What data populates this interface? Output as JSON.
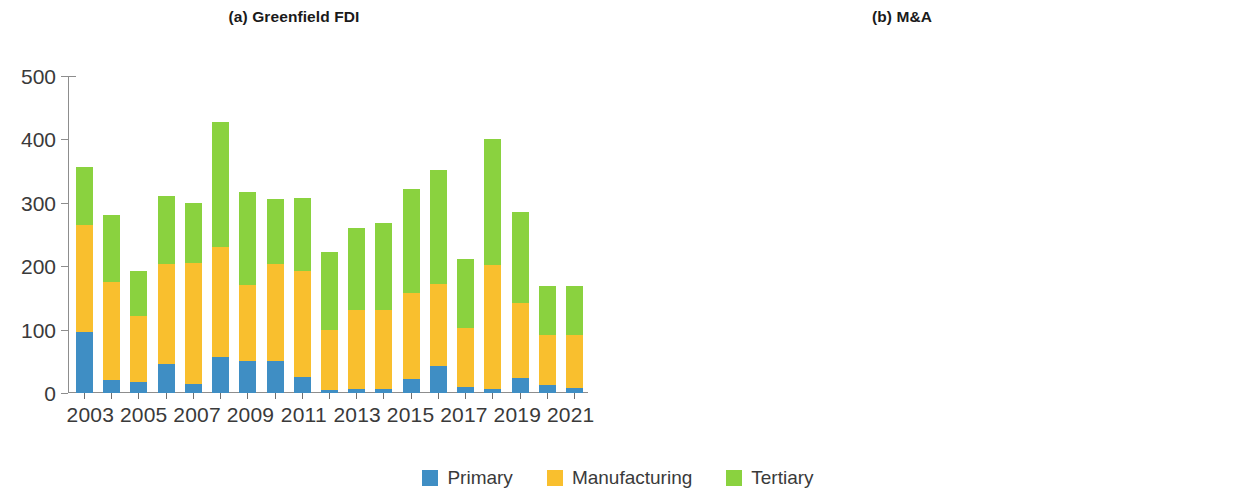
{
  "figure": {
    "series_colors": {
      "primary": "#3f8ec4",
      "manufacturing": "#f9bf2e",
      "tertiary": "#8ad23f"
    }
  },
  "legend": {
    "items": [
      {
        "label": "Primary",
        "color": "#3f8ec4",
        "swatch": "primary-swatch"
      },
      {
        "label": "Manufacturing",
        "color": "#f9bf2e",
        "swatch": "manufacturing-swatch"
      },
      {
        "label": "Tertiary",
        "color": "#8ad23f",
        "swatch": "tertiary-swatch"
      }
    ]
  },
  "yaxis": {
    "ticks": [
      "0",
      "100",
      "200",
      "300",
      "400",
      "500"
    ],
    "min": 0,
    "max": 500
  },
  "xaxis": {
    "visible_labels": [
      "2003",
      "2005",
      "2007",
      "2009",
      "2011",
      "2013",
      "2015",
      "2017",
      "2019",
      "2021"
    ]
  },
  "chart_data": [
    {
      "type": "bar",
      "id": "greenfield-fdi",
      "title": "(a) Greenfield FDI",
      "stacked": true,
      "xlabel": "",
      "ylabel": "",
      "ylim": [
        0,
        500
      ],
      "grid": false,
      "legend_position": "bottom-center",
      "categories": [
        "2003",
        "2004",
        "2005",
        "2006",
        "2007",
        "2008",
        "2009",
        "2010",
        "2011",
        "2012",
        "2013",
        "2014",
        "2015",
        "2016",
        "2017",
        "2018",
        "2019",
        "2020",
        "2021"
      ],
      "tick_labels_shown": [
        "2003",
        "",
        "2005",
        "",
        "2007",
        "",
        "2009",
        "",
        "2011",
        "",
        "2013",
        "",
        "2015",
        "",
        "2017",
        "",
        "2019",
        "",
        "2021"
      ],
      "series": [
        {
          "name": "Primary",
          "color": "#3f8ec4",
          "values": [
            97,
            21,
            18,
            45,
            15,
            57,
            50,
            50,
            25,
            5,
            6,
            7,
            22,
            42,
            9,
            6,
            24,
            12,
            8
          ]
        },
        {
          "name": "Manufacturing",
          "color": "#f9bf2e",
          "values": [
            168,
            154,
            103,
            158,
            190,
            174,
            120,
            153,
            168,
            95,
            125,
            124,
            135,
            130,
            94,
            196,
            118,
            80,
            84
          ]
        },
        {
          "name": "Tertiary",
          "color": "#8ad23f",
          "values": [
            91,
            106,
            72,
            108,
            95,
            197,
            147,
            103,
            115,
            122,
            130,
            137,
            165,
            179,
            108,
            198,
            143,
            77,
            77
          ]
        }
      ],
      "totals": [
        356,
        281,
        193,
        311,
        300,
        428,
        317,
        306,
        308,
        222,
        261,
        268,
        322,
        351,
        211,
        400,
        285,
        169,
        169
      ]
    },
    {
      "type": "bar",
      "id": "m-and-a",
      "title": "(b) M&A",
      "stacked": true,
      "xlabel": "",
      "ylabel": "",
      "ylim": [
        0,
        500
      ],
      "grid": false,
      "legend_position": "bottom-center",
      "categories": [
        "2003",
        "2004",
        "2005",
        "2006",
        "2007",
        "2008",
        "2009",
        "2010",
        "2011",
        "2012",
        "2013",
        "2014",
        "2015",
        "2016",
        "2017",
        "2018",
        "2019",
        "2020",
        "2021"
      ],
      "tick_labels_shown": [
        "2003",
        "",
        "2005",
        "",
        "2007",
        "",
        "2009",
        "",
        "2011",
        "",
        "2013",
        "",
        "2015",
        "",
        "2017",
        "",
        "2019",
        "",
        "2021"
      ],
      "series": [
        {
          "name": "Primary",
          "color": "#3f8ec4",
          "values": [
            3,
            4,
            3,
            6,
            18,
            25,
            27,
            21,
            24,
            13,
            43,
            9,
            13,
            10,
            14,
            19,
            7,
            4,
            12
          ]
        },
        {
          "name": "Manufacturing",
          "color": "#f9bf2e",
          "values": [
            8,
            26,
            24,
            24,
            64,
            42,
            41,
            26,
            54,
            27,
            65,
            42,
            48,
            44,
            48,
            56,
            55,
            49,
            49
          ]
        },
        {
          "name": "Tertiary",
          "color": "#8ad23f",
          "values": [
            26,
            45,
            39,
            46,
            130,
            264,
            58,
            69,
            58,
            68,
            92,
            107,
            121,
            131,
            83,
            251,
            106,
            99,
            105
          ]
        }
      ],
      "totals": [
        37,
        75,
        66,
        76,
        212,
        331,
        126,
        116,
        136,
        108,
        200,
        158,
        182,
        185,
        145,
        326,
        168,
        152,
        166
      ]
    }
  ]
}
